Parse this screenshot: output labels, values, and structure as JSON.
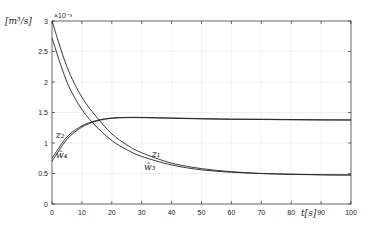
{
  "chart_data": {
    "type": "line",
    "title": "",
    "xlabel": "t[s]",
    "ylabel": "[m^3/s]",
    "y_scale_note": "×10^-3",
    "xlim": [
      0,
      100
    ],
    "ylim": [
      0,
      3
    ],
    "x_ticks": [
      "0",
      "10",
      "20",
      "30",
      "40",
      "50",
      "60",
      "70",
      "80",
      "90",
      "100"
    ],
    "y_ticks": [
      "0",
      "0.5",
      "1",
      "1.5",
      "2",
      "2.5",
      "3"
    ],
    "grid": true,
    "legend": "inline labels",
    "series": [
      {
        "name": "z1",
        "x": [
          0,
          5,
          10,
          15,
          20,
          25,
          30,
          40,
          50,
          60,
          70,
          80,
          90,
          100
        ],
        "values": [
          3.0,
          2.25,
          1.75,
          1.42,
          1.15,
          0.97,
          0.84,
          0.67,
          0.58,
          0.53,
          0.5,
          0.49,
          0.48,
          0.475
        ]
      },
      {
        "name": "ŵ3",
        "x": [
          0,
          5,
          10,
          15,
          20,
          25,
          30,
          40,
          50,
          60,
          70,
          80,
          90,
          100
        ],
        "values": [
          2.72,
          2.0,
          1.55,
          1.26,
          1.04,
          0.89,
          0.78,
          0.64,
          0.56,
          0.52,
          0.5,
          0.485,
          0.478,
          0.475
        ]
      },
      {
        "name": "z2",
        "x": [
          0,
          5,
          10,
          15,
          20,
          25,
          30,
          40,
          50,
          60,
          70,
          80,
          90,
          100
        ],
        "values": [
          0.75,
          1.1,
          1.28,
          1.37,
          1.41,
          1.42,
          1.42,
          1.41,
          1.4,
          1.39,
          1.39,
          1.385,
          1.38,
          1.38
        ]
      },
      {
        "name": "ŵ4",
        "x": [
          0,
          5,
          10,
          15,
          20,
          25,
          30,
          40,
          50,
          60,
          70,
          80,
          90,
          100
        ],
        "values": [
          0.7,
          1.06,
          1.26,
          1.36,
          1.405,
          1.415,
          1.415,
          1.405,
          1.395,
          1.39,
          1.385,
          1.38,
          1.378,
          1.375
        ]
      }
    ],
    "annotations": [
      "z2",
      "ŵ4",
      "z1",
      "ŵ3"
    ]
  },
  "labels": {
    "ylabel": "[m³/s]",
    "exp": "×10⁻³",
    "xlabel": "t[s]",
    "z1": "z₁",
    "w3": "ŵ₃",
    "z2": "z₂",
    "w4": "ŵ₄"
  }
}
